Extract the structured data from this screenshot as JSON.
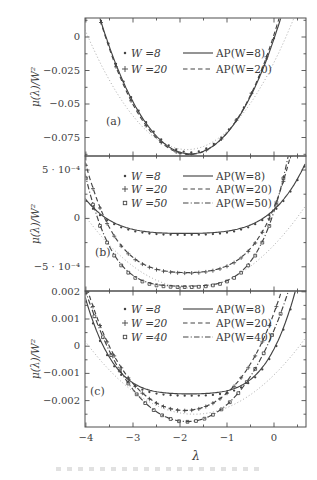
{
  "figure": {
    "bg": "#ffffff",
    "ink": "#444444",
    "light_ink": "#a6a6a6",
    "frame": "#4f4f4f",
    "text": "#3f3f3f",
    "xlabel": "λ",
    "ylabel": "μ(λ)/W²",
    "x_range": [
      -4.02,
      0.68
    ],
    "x_ticks": [
      {
        "v": -4,
        "label": "−4"
      },
      {
        "v": -3,
        "label": "−3"
      },
      {
        "v": -2,
        "label": "−2"
      },
      {
        "v": -1,
        "label": "−1"
      },
      {
        "v": 0,
        "label": "0"
      }
    ],
    "x_minor": [
      -3.5,
      -2.5,
      -1.5,
      -0.5,
      0.5
    ]
  },
  "chart_data": [
    {
      "id": "a",
      "type": "line",
      "tag": "(a)",
      "ylim": [
        -0.0888,
        0.0142
      ],
      "y_ticks": [
        {
          "v": 0,
          "label": "0"
        },
        {
          "v": -0.025,
          "label": "−0.025"
        },
        {
          "v": -0.05,
          "label": "−0.05"
        },
        {
          "v": -0.075,
          "label": "−0.075"
        }
      ],
      "y_minor": [
        0.0125,
        -0.0125,
        -0.0375,
        -0.0625,
        -0.0875
      ],
      "legend": {
        "markers": [
          {
            "marker": "dot",
            "label": "W =8"
          },
          {
            "marker": "plus",
            "label": "W =20"
          }
        ],
        "lines": [
          {
            "style": "solid",
            "label": "AP(W=8)"
          },
          {
            "style": "dashed",
            "label": "AP(W=20)"
          }
        ]
      },
      "series": [
        {
          "name": "weak-disorder reference",
          "style": "dotted",
          "marker": "none",
          "light": true,
          "vertex": [
            -1.85,
            -0.084
          ],
          "a2": 0.019,
          "a4": 0
        },
        {
          "name": "AP(W=8)",
          "style": "solid",
          "marker": "none",
          "vertex": [
            -1.78,
            -0.0872
          ],
          "a2": 0.0252,
          "a4": 0.0006
        },
        {
          "name": "AP(W=20)",
          "style": "dashed",
          "marker": "none",
          "vertex": [
            -1.8,
            -0.0877
          ],
          "a2": 0.0247,
          "a4": 0.0009
        },
        {
          "name": "W=8 data",
          "style": "none",
          "marker": "dot",
          "vertex": [
            -1.78,
            -0.0861
          ],
          "a2": 0.025,
          "a4": 0.0006,
          "marker_step": 0.16
        },
        {
          "name": "W=20 data",
          "style": "none",
          "marker": "plus",
          "vertex": [
            -1.8,
            -0.0877
          ],
          "a2": 0.0247,
          "a4": 0.0009,
          "marker_step": 0.32
        }
      ]
    },
    {
      "id": "b",
      "type": "line",
      "tag": "(b)",
      "ylim": [
        -0.00075,
        0.000645
      ],
      "y_ticks": [
        {
          "v": 0.0005,
          "label": "5 · 10⁻⁴"
        },
        {
          "v": 0,
          "label": "0"
        },
        {
          "v": -0.0005,
          "label": "−5 · 10⁻⁴"
        }
      ],
      "y_minor": [
        0.00025,
        -0.00025
      ],
      "legend": {
        "markers": [
          {
            "marker": "dot",
            "label": "W =8"
          },
          {
            "marker": "plus",
            "label": "W =20"
          },
          {
            "marker": "square",
            "label": "W =50"
          }
        ],
        "lines": [
          {
            "style": "solid",
            "label": "AP(W=8)"
          },
          {
            "style": "dashed",
            "label": "AP(W=20)"
          },
          {
            "style": "dashdot",
            "label": "AP(W=50)"
          }
        ]
      },
      "series": [
        {
          "name": "weak-disorder reference",
          "style": "dotted",
          "marker": "none",
          "light": true,
          "vertex": [
            -1.75,
            -0.00072
          ],
          "a2": 0.000145,
          "a4": 0
        },
        {
          "name": "AP(W=8)",
          "style": "solid",
          "marker": "none",
          "vertex": [
            -1.9,
            -0.000155
          ],
          "a2": 1.75e-05,
          "a4": 1.4e-05
        },
        {
          "name": "AP(W=20)",
          "style": "dashed",
          "marker": "none",
          "vertex": [
            -1.85,
            -0.00056
          ],
          "a2": 7e-05,
          "a4": 3.7e-05
        },
        {
          "name": "AP(W=50)",
          "style": "dashdot",
          "marker": "none",
          "vertex": [
            -1.9,
            -0.0007
          ],
          "a2": 3e-05,
          "a4": 5.1e-05
        },
        {
          "name": "W=8 data",
          "style": "none",
          "marker": "dot",
          "vertex": [
            -1.9,
            -0.00017
          ],
          "a2": 1.75e-05,
          "a4": 1.4e-05,
          "marker_step": 0.15
        },
        {
          "name": "W=20 data",
          "style": "none",
          "marker": "plus",
          "vertex": [
            -1.85,
            -0.000565
          ],
          "a2": 7e-05,
          "a4": 3.7e-05,
          "marker_step": 0.15
        },
        {
          "name": "W=50 data",
          "style": "none",
          "marker": "square",
          "vertex": [
            -1.9,
            -0.00071
          ],
          "a2": 3e-05,
          "a4": 5.1e-05,
          "marker_step": 0.15
        }
      ]
    },
    {
      "id": "c",
      "type": "line",
      "tag": "(c)",
      "ylim": [
        -0.00297,
        0.00203
      ],
      "y_ticks": [
        {
          "v": 0.002,
          "label": "0.002"
        },
        {
          "v": 0.001,
          "label": "0.001"
        },
        {
          "v": 0,
          "label": "0"
        },
        {
          "v": -0.001,
          "label": "−0.001"
        },
        {
          "v": -0.002,
          "label": "−0.002"
        }
      ],
      "y_minor": [
        0.0015,
        0.0005,
        -0.0005,
        -0.0015,
        -0.0025
      ],
      "legend": {
        "markers": [
          {
            "marker": "dot",
            "label": "W =8"
          },
          {
            "marker": "plus",
            "label": "W =20"
          },
          {
            "marker": "square",
            "label": "W =40"
          }
        ],
        "lines": [
          {
            "style": "solid",
            "label": "AP(W=8)"
          },
          {
            "style": "dashed",
            "label": "AP(W=20)"
          },
          {
            "style": "dashdot",
            "label": "AP(W=40)"
          }
        ]
      },
      "series": [
        {
          "name": "weak-disorder reference",
          "style": "dotted",
          "marker": "none",
          "light": true,
          "vertex": [
            -1.7,
            -0.0025
          ],
          "a2": 0.0005,
          "a4": 0
        },
        {
          "name": "AP(W=8)",
          "style": "solid",
          "marker": "none",
          "vertex": [
            -1.8,
            -0.00175
          ],
          "a2": 9.5e-05,
          "a4": 0.000128
        },
        {
          "name": "AP(W=20)",
          "style": "dashed",
          "marker": "none",
          "vertex": [
            -1.9,
            -0.00236
          ],
          "a2": 0.000736,
          "a4": 7.1e-05
        },
        {
          "name": "AP(W=40)",
          "style": "dashdot",
          "marker": "none",
          "vertex": [
            -1.85,
            -0.00277
          ],
          "a2": 0.000837,
          "a4": 4.2e-05
        },
        {
          "name": "W=8 data",
          "style": "none",
          "marker": "dot",
          "vertex": [
            -1.8,
            -0.00182
          ],
          "a2": 9.5e-05,
          "a4": 0.000128,
          "marker_step": 0.15
        },
        {
          "name": "W=20 data",
          "style": "none",
          "marker": "plus",
          "vertex": [
            -1.9,
            -0.00237
          ],
          "a2": 0.000736,
          "a4": 7.1e-05,
          "marker_step": 0.15
        },
        {
          "name": "W=40 data",
          "style": "none",
          "marker": "square",
          "vertex": [
            -1.85,
            -0.00278
          ],
          "a2": 0.000837,
          "a4": 4.2e-05,
          "marker_step": 0.18
        }
      ]
    }
  ]
}
